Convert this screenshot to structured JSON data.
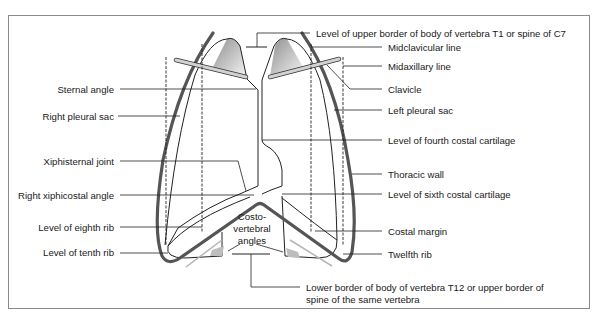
{
  "diagram": {
    "center_label": [
      "Costo-",
      "vertebral",
      "angles"
    ],
    "left_labels": [
      {
        "id": "sternal-angle",
        "text": "Sternal angle"
      },
      {
        "id": "right-pleural-sac",
        "text": "Right pleural sac"
      },
      {
        "id": "xiphisternal-joint",
        "text": "Xiphisternal joint"
      },
      {
        "id": "right-xiphicostal-angle",
        "text": "Right xiphicostal angle"
      },
      {
        "id": "level-eighth-rib",
        "text": "Level of eighth rib"
      },
      {
        "id": "level-tenth-rib",
        "text": "Level of tenth rib"
      }
    ],
    "right_labels": [
      {
        "id": "upper-border-t1",
        "text": "Level of upper border of body of vertebra T1 or spine of C7"
      },
      {
        "id": "midclavicular-line",
        "text": "Midclavicular line"
      },
      {
        "id": "midaxillary-line",
        "text": "Midaxillary line"
      },
      {
        "id": "clavicle",
        "text": "Clavicle"
      },
      {
        "id": "left-pleural-sac",
        "text": "Left pleural sac"
      },
      {
        "id": "level-fourth-costal-cartilage",
        "text": "Level of fourth costal cartilage"
      },
      {
        "id": "thoracic-wall",
        "text": "Thoracic wall"
      },
      {
        "id": "level-sixth-costal-cartilage",
        "text": "Level of sixth costal cartilage"
      },
      {
        "id": "costal-margin",
        "text": "Costal margin"
      },
      {
        "id": "twelfth-rib",
        "text": "Twelfth rib"
      }
    ],
    "bottom_label": {
      "line1": "Lower border of body of vertebra T12 or upper border of",
      "line2": "spine of the same vertebra"
    },
    "colors": {
      "thoracic_wall": "#555555",
      "clavicle_fill": "#c8c8c8",
      "apex_fill": "#b0b0b0",
      "lines": "#222222",
      "frame": "#8a8a8a"
    }
  }
}
